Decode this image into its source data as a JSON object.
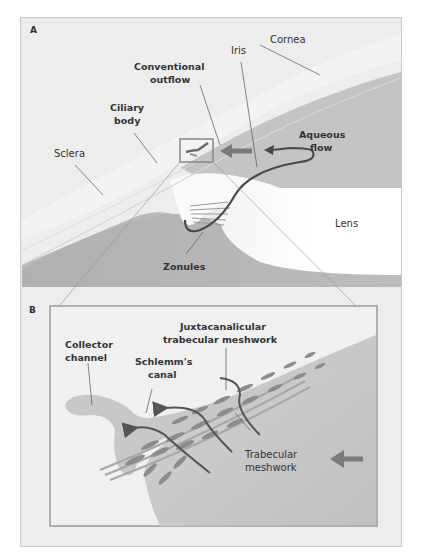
{
  "figure": {
    "panel_a": {
      "letter": "A",
      "labels": {
        "cornea": "Cornea",
        "iris": "Iris",
        "conventional_outflow_1": "Conventional",
        "conventional_outflow_2": "outflow",
        "ciliary_body_1": "Ciliary",
        "ciliary_body_2": "body",
        "aqueous_flow_1": "Aqueous",
        "aqueous_flow_2": "flow",
        "sclera": "Sclera",
        "lens": "Lens",
        "zonules": "Zonules"
      }
    },
    "panel_b": {
      "letter": "B",
      "labels": {
        "juxta_1": "Juxtacanalicular",
        "juxta_2": "trabecular meshwork",
        "collector_1": "Collector",
        "collector_2": "channel",
        "schlemm_1": "Schlemm's",
        "schlemm_2": "canal",
        "trabecular_1": "Trabecular",
        "trabecular_2": "meshwork"
      }
    },
    "colors": {
      "background": "#ededed",
      "tissue_dark": "#b4b4b4",
      "tissue_mid": "#cfcfcf",
      "lens": "#ffffff",
      "arrow": "#7a7a7a",
      "flow_line": "#4a4a4a",
      "text": "#333333"
    }
  }
}
